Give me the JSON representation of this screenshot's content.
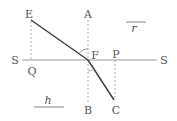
{
  "diagram": {
    "colors": {
      "ray": "#3a3a3a",
      "surface": "#999999",
      "guide": "#999999",
      "text": "#555555"
    },
    "labels": {
      "E": "E",
      "A": "A",
      "F": "F",
      "P": "P",
      "S_left": "S",
      "S_right": "S",
      "Q": "Q",
      "B": "B",
      "C": "C",
      "r": "r",
      "h": "h"
    },
    "elements": {
      "incident_ray": "E to F",
      "refracted_ray": "F to C",
      "surface": "S–S horizontal line",
      "normal": "A–B dashed vertical through F",
      "projection_EQ": "dashed from E to Q",
      "projection_PC": "dashed from P to C",
      "angle_incidence_arc": "arc at F between FA and FE",
      "angle_refraction_arc": "arc at F between FB and FC"
    }
  }
}
